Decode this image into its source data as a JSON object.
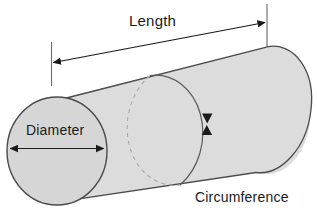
{
  "diagram": {
    "labels": {
      "length": "Length",
      "diameter": "Diameter",
      "circumference": "Circumference"
    },
    "colors": {
      "body_fill": "#dcdcdc",
      "end_face_fill": "#d6d6d6",
      "outline": "#4a4a4a",
      "dashed_outline": "#9a9a9a",
      "arrow": "#1a1a1a",
      "text": "#1a1a1a",
      "background": "#ffffff"
    },
    "annotations": [
      {
        "name": "length-dimension",
        "label": "Length",
        "style": "double-ended-arrow",
        "measures": "axial length of cylinder"
      },
      {
        "name": "diameter-dimension",
        "label": "Diameter",
        "style": "double-ended-arrow",
        "measures": "diameter of circular end face"
      },
      {
        "name": "circumference-dimension",
        "label": "Circumference",
        "style": "opposed-arrowheads",
        "measures": "circumference around cylinder cross-section"
      }
    ]
  }
}
